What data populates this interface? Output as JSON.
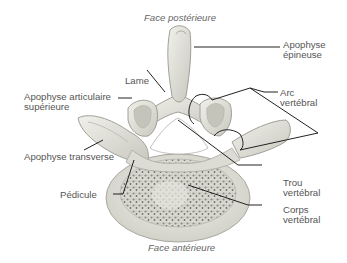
{
  "diagram": {
    "title_top": "Face postérieure",
    "title_bottom": "Face antérieure",
    "labels": {
      "apophyse_epineuse": [
        "Apophyse",
        "épineuse"
      ],
      "lame": [
        "Lame"
      ],
      "apophyse_articulaire": [
        "Apophyse articulaire",
        "supérieure"
      ],
      "arc_vertebral": [
        "Arc",
        "vertébral"
      ],
      "apophyse_transverse": [
        "Apophyse transverse"
      ],
      "pedicule": [
        "Pédicule"
      ],
      "trou_vertebral": [
        "Trou",
        "vertébral"
      ],
      "corps_vertebral": [
        "Corps",
        "vertébral"
      ]
    },
    "colors": {
      "bone_fill": "#e9e9e2",
      "bone_shade": "#c9c9c0",
      "bone_outline": "#9a9a92",
      "cancellous": "#8a8a82",
      "leader_line": "#222222",
      "text": "#555555"
    }
  }
}
